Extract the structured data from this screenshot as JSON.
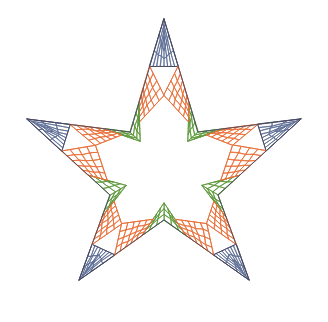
{
  "figure": {
    "type": "mesh-diagram",
    "background_color": "#ffffff",
    "canvas": {
      "width": 328,
      "height": 322
    }
  },
  "palette": {
    "blue": "#5f6f96",
    "orange": "#e8703a",
    "green": "#5f9a3c",
    "background": "#ffffff",
    "boundary": "#4a4a62"
  },
  "star": {
    "center": {
      "x": 164,
      "y": 163
    },
    "outer_radius": 144,
    "inner_radius": 57,
    "points": 5,
    "rotation_deg": -90,
    "outer_vertices": [
      {
        "label": "top",
        "x": 164,
        "y": 19
      },
      {
        "label": "right",
        "x": 301,
        "y": 119
      },
      {
        "label": "bottom-right",
        "x": 249,
        "y": 280
      },
      {
        "label": "bottom-left",
        "x": 79,
        "y": 280
      },
      {
        "label": "left",
        "x": 27,
        "y": 119
      }
    ],
    "inner_vertices": [
      {
        "label": "upper-right",
        "x": 198,
        "y": 132
      },
      {
        "label": "lower-right",
        "x": 218,
        "y": 195
      },
      {
        "label": "bottom",
        "x": 164,
        "y": 220
      },
      {
        "label": "lower-left",
        "x": 110,
        "y": 195
      },
      {
        "label": "upper-left",
        "x": 130,
        "y": 132
      }
    ]
  },
  "mesh_regions": [
    {
      "name": "point-cap",
      "color_key": "blue",
      "count": 5,
      "description": "Quad mesh cap at each of the five outer star points",
      "divisions_u": 4,
      "divisions_v": 3
    },
    {
      "name": "arm-band",
      "color_key": "orange",
      "count": 10,
      "description": "Quad mesh band along each star arm edge between point cap and inner corner",
      "divisions_u": 4,
      "divisions_v": 5
    },
    {
      "name": "inner-corner",
      "color_key": "green",
      "count": 5,
      "description": "Small quad mesh patch at each reentrant inner vertex",
      "divisions_u": 3,
      "divisions_v": 3
    }
  ],
  "chart_data": {
    "type": "mesh",
    "xlabel": "",
    "ylabel": "",
    "grid": false,
    "legend": null,
    "regions": [
      {
        "name": "point-cap",
        "color": "#5f6f96",
        "patches": 5,
        "cells_per_patch": 12
      },
      {
        "name": "arm-band",
        "color": "#e8703a",
        "patches": 10,
        "cells_per_patch": 20
      },
      {
        "name": "inner-corner",
        "color": "#5f9a3c",
        "patches": 5,
        "cells_per_patch": 9
      }
    ],
    "total_patches": 20,
    "symmetry_order": 5
  }
}
